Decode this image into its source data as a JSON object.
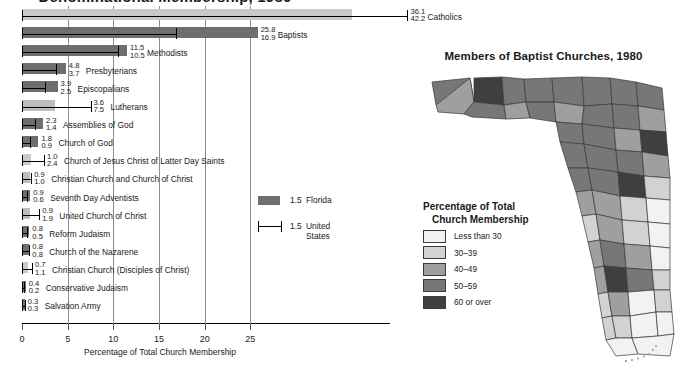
{
  "bar_chart": {
    "title": "Denominational Membership, 1980",
    "xaxis_title": "Percentage of Total Church Membership",
    "tick_labels": [
      "0",
      "5",
      "10",
      "15",
      "20",
      "25"
    ],
    "key": {
      "florida": {
        "swatch_value": "1.5",
        "label": "Florida"
      },
      "united_states": {
        "whisker_value": "1.5",
        "label": "United States"
      }
    }
  },
  "chart_data": {
    "type": "bar",
    "title": "Denominational Membership, 1980",
    "xlabel": "Percentage of Total Church Membership",
    "ylabel": "",
    "xlim": [
      0,
      45
    ],
    "ticks": [
      0,
      5,
      10,
      15,
      20,
      25
    ],
    "grid": true,
    "orientation": "horizontal",
    "legend": [
      "Florida",
      "United States"
    ],
    "legend_position": "center",
    "categories": [
      "Catholics",
      "Baptists",
      "Methodists",
      "Presbyterians",
      "Episcopalians",
      "Lutherans",
      "Assemblies of God",
      "Church of God",
      "Church of Jesus Christ of Latter Day Saints",
      "Christian Church and Church of Christ",
      "Seventh Day Adventists",
      "United Church of Christ",
      "Reform Judaism",
      "Church of the Nazarene",
      "Christian Church (Disciples of Christ)",
      "Conservative Judaism",
      "Salvation Army"
    ],
    "series": [
      {
        "name": "Florida",
        "values": [
          36.1,
          25.8,
          11.5,
          4.8,
          3.9,
          3.6,
          2.3,
          1.8,
          1.0,
          0.9,
          0.9,
          0.9,
          0.8,
          0.8,
          0.7,
          0.4,
          0.3
        ]
      },
      {
        "name": "United States",
        "values": [
          42.2,
          16.9,
          10.5,
          3.7,
          2.5,
          7.5,
          1.4,
          0.9,
          2.4,
          1.0,
          0.6,
          1.9,
          0.5,
          0.8,
          1.1,
          0.2,
          0.3
        ]
      }
    ]
  },
  "rows": [
    {
      "name": "Catholics",
      "fl": "36.1",
      "us": "42.2"
    },
    {
      "name": "Baptists",
      "fl": "25.8",
      "us": "16.9"
    },
    {
      "name": "Methodists",
      "fl": "11.5",
      "us": "10.5"
    },
    {
      "name": "Presbyterians",
      "fl": "4.8",
      "us": "3.7"
    },
    {
      "name": "Episcopalians",
      "fl": "3.9",
      "us": "2.5"
    },
    {
      "name": "Lutherans",
      "fl": "3.6",
      "us": "7.5"
    },
    {
      "name": "Assemblies of God",
      "fl": "2.3",
      "us": "1.4"
    },
    {
      "name": "Church of God",
      "fl": "1.8",
      "us": "0.9"
    },
    {
      "name": "Church of Jesus Christ of Latter Day Saints",
      "fl": "1.0",
      "us": "2.4"
    },
    {
      "name": "Christian Church and Church of Christ",
      "fl": "0.9",
      "us": "1.0"
    },
    {
      "name": "Seventh Day Adventists",
      "fl": "0.9",
      "us": "0.6"
    },
    {
      "name": "United Church of Christ",
      "fl": "0.9",
      "us": "1.9"
    },
    {
      "name": "Reform Judaism",
      "fl": "0.8",
      "us": "0.5"
    },
    {
      "name": "Church of the Nazarene",
      "fl": "0.8",
      "us": "0.8"
    },
    {
      "name": "Christian Church (Disciples of Christ)",
      "fl": "0.7",
      "us": "1.1"
    },
    {
      "name": "Conservative Judaism",
      "fl": "0.4",
      "us": "0.2"
    },
    {
      "name": "Salvation Army",
      "fl": "0.3",
      "us": "0.3"
    }
  ],
  "map": {
    "title": "Members of Baptist Churches, 1980",
    "legend": {
      "heading_line1": "Percentage of Total",
      "heading_line2": "Church Membership",
      "classes": [
        {
          "label": "Less than 30",
          "color": "#f2f2f2"
        },
        {
          "label": "30–39",
          "color": "#d2d2d2"
        },
        {
          "label": "40–49",
          "color": "#9f9f9f"
        },
        {
          "label": "50–59",
          "color": "#777777"
        },
        {
          "label": "60 or over",
          "color": "#3f3f3f"
        }
      ]
    }
  }
}
